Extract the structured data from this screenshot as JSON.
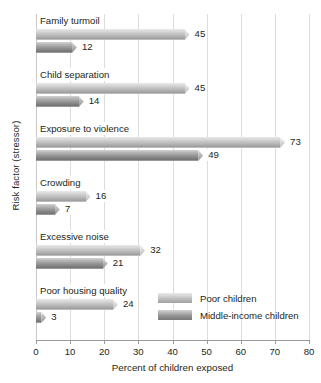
{
  "chart_data": {
    "type": "bar",
    "orientation": "horizontal",
    "title": "",
    "xlabel": "Percent of children exposed",
    "ylabel": "Risk factor (stressor)",
    "xlim": [
      0,
      80
    ],
    "xticks": [
      0,
      10,
      20,
      30,
      40,
      50,
      60,
      70,
      80
    ],
    "grid": true,
    "legend_position": "inside-lower-right",
    "categories": [
      "Family turmoil",
      "Child separation",
      "Exposure to violence",
      "Crowding",
      "Excessive noise",
      "Poor housing quality"
    ],
    "series": [
      {
        "name": "Poor children",
        "color": "#b8b8b8",
        "values": [
          45,
          45,
          73,
          16,
          32,
          24
        ]
      },
      {
        "name": "Middle-income children",
        "color": "#8f8f8f",
        "values": [
          12,
          14,
          49,
          7,
          21,
          3
        ]
      }
    ]
  },
  "legend": {
    "items": [
      {
        "label": "Poor children"
      },
      {
        "label": "Middle-income children"
      }
    ]
  }
}
